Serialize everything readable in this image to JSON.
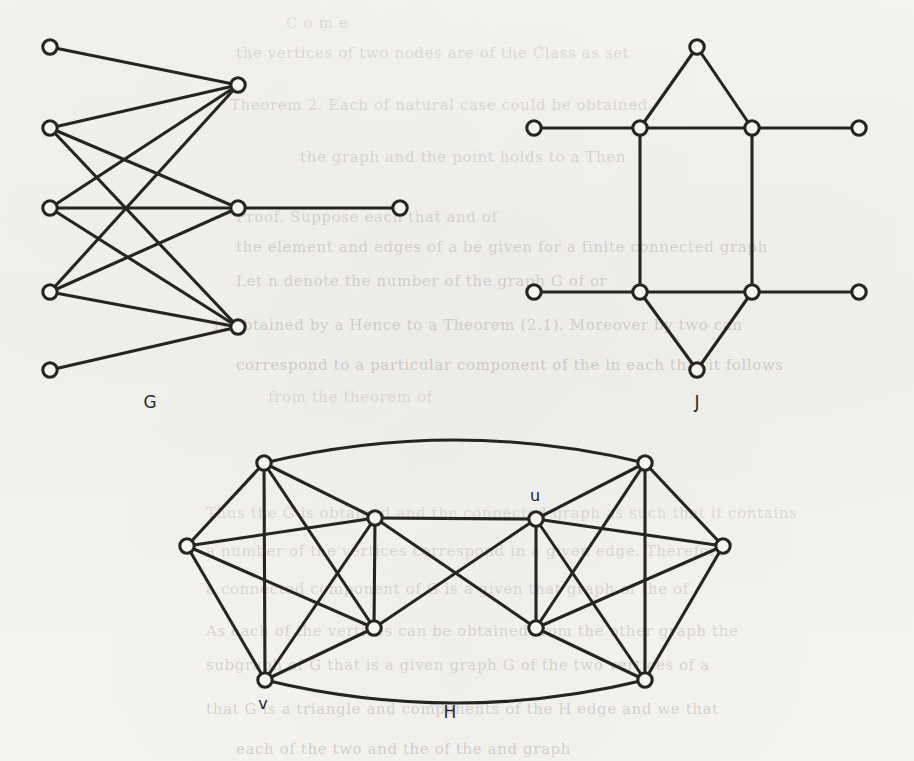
{
  "page": {
    "width": 914,
    "height": 761,
    "background_color": "#f4f3f0",
    "ink_color": "#262522",
    "node_fill_color": "#f7f6f3"
  },
  "figures": [
    {
      "id": "G",
      "label": "G",
      "label_pos": [
        150,
        402
      ],
      "node_count": 9,
      "edge_count": 11
    },
    {
      "id": "J",
      "label": "J",
      "label_pos": [
        697,
        402
      ],
      "node_count": 10,
      "edge_count": 11
    },
    {
      "id": "H",
      "label": "H",
      "label_pos": [
        450,
        712
      ],
      "node_count": 10,
      "edge_count": 25
    }
  ],
  "vertex_labels": [
    {
      "text": "u",
      "x": 535,
      "y": 495,
      "figure": "H"
    },
    {
      "text": "v",
      "x": 263,
      "y": 703,
      "figure": "H"
    }
  ],
  "chart_data": {
    "type": "diagram",
    "graphs": [
      {
        "name": "G",
        "layout": "bipartite",
        "nodes": [
          {
            "id": "a1",
            "x": 50,
            "y": 47
          },
          {
            "id": "a2",
            "x": 50,
            "y": 128
          },
          {
            "id": "a3",
            "x": 50,
            "y": 208
          },
          {
            "id": "a4",
            "x": 50,
            "y": 292
          },
          {
            "id": "a5",
            "x": 50,
            "y": 370
          },
          {
            "id": "b1",
            "x": 238,
            "y": 85
          },
          {
            "id": "b2",
            "x": 238,
            "y": 208
          },
          {
            "id": "b3",
            "x": 238,
            "y": 327
          },
          {
            "id": "c1",
            "x": 400,
            "y": 208
          }
        ],
        "edges": [
          [
            "a1",
            "b1"
          ],
          [
            "a2",
            "b1"
          ],
          [
            "a2",
            "b2"
          ],
          [
            "a2",
            "b3"
          ],
          [
            "a3",
            "b1"
          ],
          [
            "a3",
            "b2"
          ],
          [
            "a3",
            "b3"
          ],
          [
            "a4",
            "b1"
          ],
          [
            "a4",
            "b2"
          ],
          [
            "a4",
            "b3"
          ],
          [
            "a5",
            "b3"
          ],
          [
            "b2",
            "c1"
          ]
        ]
      },
      {
        "name": "J",
        "layout": "prism-with-pendants",
        "nodes": [
          {
            "id": "t",
            "x": 697,
            "y": 47
          },
          {
            "id": "p1",
            "x": 640,
            "y": 128
          },
          {
            "id": "p2",
            "x": 752,
            "y": 128
          },
          {
            "id": "p3",
            "x": 640,
            "y": 292
          },
          {
            "id": "p4",
            "x": 752,
            "y": 292
          },
          {
            "id": "bm",
            "x": 697,
            "y": 370
          },
          {
            "id": "l1",
            "x": 534,
            "y": 128
          },
          {
            "id": "r1",
            "x": 859,
            "y": 128
          },
          {
            "id": "l2",
            "x": 534,
            "y": 292
          },
          {
            "id": "r2",
            "x": 859,
            "y": 292
          }
        ],
        "edges": [
          [
            "t",
            "p1"
          ],
          [
            "t",
            "p2"
          ],
          [
            "p1",
            "p2"
          ],
          [
            "p1",
            "p3"
          ],
          [
            "p2",
            "p4"
          ],
          [
            "p3",
            "p4"
          ],
          [
            "p3",
            "bm"
          ],
          [
            "p4",
            "bm"
          ],
          [
            "l1",
            "p1"
          ],
          [
            "p2",
            "r1"
          ],
          [
            "l2",
            "p3"
          ],
          [
            "p4",
            "r2"
          ]
        ]
      },
      {
        "name": "H",
        "layout": "two-joined-K5",
        "nodes": [
          {
            "id": "L1",
            "x": 264,
            "y": 463,
            "label": ""
          },
          {
            "id": "L2",
            "x": 187,
            "y": 546,
            "label": ""
          },
          {
            "id": "L3",
            "x": 375,
            "y": 518,
            "label": ""
          },
          {
            "id": "L4",
            "x": 374,
            "y": 628,
            "label": ""
          },
          {
            "id": "v",
            "x": 265,
            "y": 680,
            "label": "v"
          },
          {
            "id": "u",
            "x": 536,
            "y": 519,
            "label": "u"
          },
          {
            "id": "R1",
            "x": 645,
            "y": 463,
            "label": ""
          },
          {
            "id": "R2",
            "x": 723,
            "y": 546,
            "label": ""
          },
          {
            "id": "R3",
            "x": 536,
            "y": 628,
            "label": ""
          },
          {
            "id": "R4",
            "x": 645,
            "y": 680,
            "label": ""
          }
        ],
        "edges": [
          [
            "L1",
            "L2"
          ],
          [
            "L1",
            "L3"
          ],
          [
            "L1",
            "L4"
          ],
          [
            "L1",
            "v"
          ],
          [
            "L2",
            "L3"
          ],
          [
            "L2",
            "L4"
          ],
          [
            "L2",
            "v"
          ],
          [
            "L3",
            "L4"
          ],
          [
            "L3",
            "v"
          ],
          [
            "L4",
            "v"
          ],
          [
            "R1",
            "R2"
          ],
          [
            "R1",
            "u"
          ],
          [
            "R1",
            "R3"
          ],
          [
            "R1",
            "R4"
          ],
          [
            "R2",
            "u"
          ],
          [
            "R2",
            "R3"
          ],
          [
            "R2",
            "R4"
          ],
          [
            "u",
            "R3"
          ],
          [
            "u",
            "R4"
          ],
          [
            "R3",
            "R4"
          ],
          [
            "L3",
            "u"
          ],
          [
            "L3",
            "R3"
          ],
          [
            "L4",
            "u"
          ],
          [
            "L1",
            "R1"
          ],
          [
            "v",
            "R4"
          ]
        ],
        "curved_edges": [
          [
            "L1",
            "R1"
          ],
          [
            "v",
            "R4"
          ]
        ]
      }
    ]
  },
  "background_text": {
    "note": "faint show-through of printed text from the opposite page",
    "lines": [
      {
        "text": "C   o  m  e",
        "x": 286,
        "y": 14
      },
      {
        "text": "the vertices of two  nodes  are of the  Class  as  set",
        "x": 236,
        "y": 44
      },
      {
        "text": "Theorem  2.  Each  of  natural  case  could  be  obtained",
        "x": 230,
        "y": 96
      },
      {
        "text": "the graph and the point holds to a  Then",
        "x": 300,
        "y": 148
      },
      {
        "text": "Proof.    Suppose  each  that  and  of",
        "x": 236,
        "y": 208
      },
      {
        "text": "the element  and  edges  of  a  be  given  for  a  finite  connected  graph",
        "x": 236,
        "y": 238
      },
      {
        "text": "Let  n  denote  the  number of  the  graph  G  of  or",
        "x": 236,
        "y": 272
      },
      {
        "text": "is obtained  by  a   Hence  to   a   Theorem  (2.1).  Moreover  by  two  can",
        "x": 214,
        "y": 316
      },
      {
        "text": "correspond  to  a  particular  component  of  the  in  each  that  it  follows",
        "x": 236,
        "y": 356
      },
      {
        "text": "from the theorem  of",
        "x": 268,
        "y": 388
      },
      {
        "text": "Thus the  G  is  obtained  and  the  connected  graph  as  such  that  it  contains",
        "x": 206,
        "y": 504
      },
      {
        "text": "a  number  of  the  vertices  correspond  in  a  given  edge.  Therefore",
        "x": 206,
        "y": 542
      },
      {
        "text": "a   connected  component   of  G   is  a   given  that   graph  of   the   of",
        "x": 206,
        "y": 580
      },
      {
        "text": "As  each  of  the   vertices  can  be  obtained  from  the  other  graph  the",
        "x": 206,
        "y": 622
      },
      {
        "text": "subgraph  of  G  that  is  a  given  graph  G  of  the  two  vertices  of  a",
        "x": 206,
        "y": 656
      },
      {
        "text": "that  G   is  a   triangle  and  components  of   the  H   edge   and   we  that",
        "x": 206,
        "y": 700
      },
      {
        "text": "each of the two  and  the  of  the  and  graph",
        "x": 236,
        "y": 740
      }
    ]
  }
}
